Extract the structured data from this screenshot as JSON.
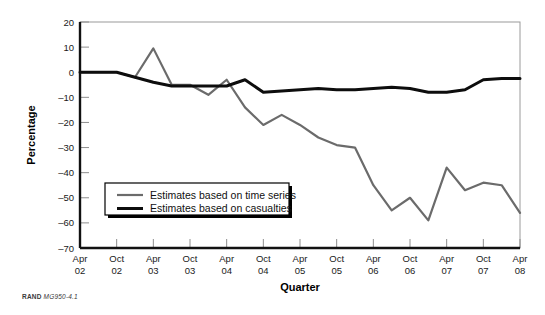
{
  "figure": {
    "credit_org": "RAND",
    "credit_id": "MG950-4.1"
  },
  "chart_data": {
    "type": "line",
    "title": "",
    "xlabel": "Quarter",
    "ylabel": "Percentage",
    "ylim": [
      -70,
      20
    ],
    "ytick_values": [
      20,
      10,
      0,
      -10,
      -20,
      -30,
      -40,
      -50,
      -60,
      -70
    ],
    "ytick_labels": [
      "20",
      "10",
      "0",
      "–10",
      "–20",
      "–30",
      "–40",
      "–50",
      "–60",
      "–70"
    ],
    "grid": false,
    "legend_position": "lower-left-inside",
    "x": [
      "Apr 02",
      "Jul 02",
      "Oct 02",
      "Jan 03",
      "Apr 03",
      "Jul 03",
      "Oct 03",
      "Jan 04",
      "Apr 04",
      "Jul 04",
      "Oct 04",
      "Jan 05",
      "Apr 05",
      "Jul 05",
      "Oct 05",
      "Jan 06",
      "Apr 06",
      "Jul 06",
      "Oct 06",
      "Jan 07",
      "Apr 07",
      "Jul 07",
      "Oct 07",
      "Jan 08",
      "Apr 08"
    ],
    "xtick_labels": [
      {
        "month": "Apr",
        "year": "02"
      },
      {
        "month": "Oct",
        "year": "02"
      },
      {
        "month": "Apr",
        "year": "03"
      },
      {
        "month": "Oct",
        "year": "03"
      },
      {
        "month": "Apr",
        "year": "04"
      },
      {
        "month": "Oct",
        "year": "04"
      },
      {
        "month": "Apr",
        "year": "05"
      },
      {
        "month": "Oct",
        "year": "05"
      },
      {
        "month": "Apr",
        "year": "06"
      },
      {
        "month": "Oct",
        "year": "06"
      },
      {
        "month": "Apr",
        "year": "07"
      },
      {
        "month": "Oct",
        "year": "07"
      },
      {
        "month": "Apr",
        "year": "08"
      }
    ],
    "series": [
      {
        "name": "Estimates based on time series",
        "color": "#6b6b6b",
        "width": 2.2,
        "values": [
          0,
          0,
          0,
          -2,
          9.5,
          -5,
          -5,
          -9,
          -3,
          -14,
          -21,
          -17,
          -21,
          -26,
          -29,
          -30,
          -45,
          -55,
          -50,
          -59,
          -38,
          -47,
          -44,
          -45,
          -56
        ]
      },
      {
        "name": "Estimates based on casualties",
        "color": "#0d0d0d",
        "width": 3.0,
        "values": [
          0,
          0,
          0,
          -2,
          -4,
          -5.5,
          -5.5,
          -5.5,
          -5.5,
          -3,
          -8,
          -7.5,
          -7,
          -6.5,
          -7,
          -7,
          -6.5,
          -6,
          -6.5,
          -8,
          -8,
          -7,
          -3,
          -2.5,
          -2.5
        ]
      }
    ],
    "legend": [
      {
        "label": "Estimates based on time series",
        "color": "#6b6b6b",
        "width": 2.2
      },
      {
        "label": "Estimates based on casualties",
        "color": "#0d0d0d",
        "width": 3.0
      }
    ]
  }
}
